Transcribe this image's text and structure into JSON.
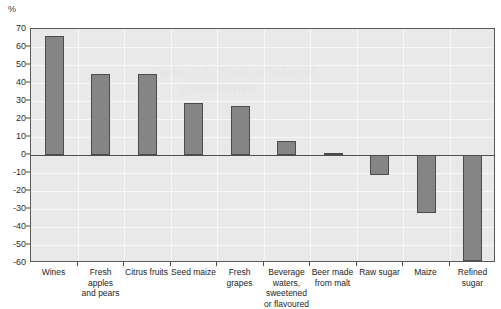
{
  "chart_data": {
    "type": "bar",
    "title": "",
    "xlabel": "",
    "ylabel": "%",
    "ylim": [
      -60,
      70
    ],
    "ystep": 10,
    "grid": true,
    "legend": "none",
    "yticks": [
      "70",
      "60",
      "50",
      "40",
      "30",
      "20",
      "10",
      "0",
      "-10",
      "-20",
      "-30",
      "-40",
      "-50",
      "-60"
    ],
    "categories": [
      "Wines",
      "Fresh apples and pears",
      "Citrus fruits",
      "Seed maize",
      "Fresh grapes",
      "Beverage waters, sweetened or flavoured",
      "Beer made from malt",
      "Raw sugar",
      "Maize",
      "Refined sugar"
    ],
    "category_lines": [
      [
        "Wines"
      ],
      [
        "Fresh apples",
        "and pears"
      ],
      [
        "Citrus fruits"
      ],
      [
        "Seed maize"
      ],
      [
        "Fresh grapes"
      ],
      [
        "Beverage",
        "waters,",
        "sweetened",
        "or flavoured"
      ],
      [
        "Beer made",
        "from malt"
      ],
      [
        "Raw sugar"
      ],
      [
        "Maize"
      ],
      [
        "Refined",
        "sugar"
      ]
    ],
    "values": [
      66,
      45,
      45,
      29,
      27,
      8,
      1,
      -11,
      -32,
      -59
    ],
    "bar_color": "#858585",
    "bar_border_color": "#4b4b4b",
    "plot_background": "#e9e9e9",
    "gridline_color": "#f7f7f7",
    "axis_color": "#5a5a5a"
  },
  "bleed_text": {
    "line1": "Figure 2.1. Trade of selected",
    "line2": "commodities"
  }
}
